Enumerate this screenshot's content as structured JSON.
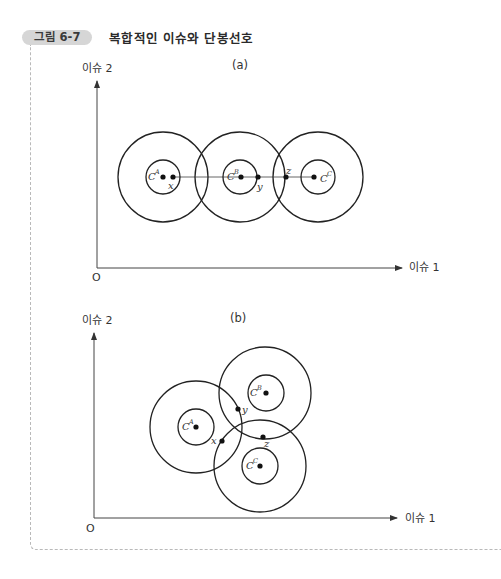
{
  "figure": {
    "badge": "그림 6-7",
    "title": "복합적인 이슈와 단봉선호"
  },
  "panels": [
    {
      "id": "a",
      "label": "(a)",
      "x_axis_label": "이슈 1",
      "y_axis_label": "이슈 2",
      "origin_label": "O",
      "circles": [
        {
          "name": "A",
          "center": [
            163,
            177
          ],
          "inner_r": 17,
          "outer_r": 45,
          "ideal_label": "C",
          "ideal_sup": "A"
        },
        {
          "name": "B",
          "center": [
            240,
            177
          ],
          "inner_r": 17,
          "outer_r": 45,
          "ideal_label": "C",
          "ideal_sup": "B"
        },
        {
          "name": "C",
          "center": [
            318,
            177
          ],
          "inner_r": 17,
          "outer_r": 45,
          "ideal_label": "C",
          "ideal_sup": "C"
        }
      ],
      "points": [
        {
          "label": "x",
          "pos": [
            173,
            177
          ]
        },
        {
          "label": "y",
          "pos": [
            258,
            177
          ]
        },
        {
          "label": "z",
          "pos": [
            286,
            177
          ]
        }
      ]
    },
    {
      "id": "b",
      "label": "(b)",
      "x_axis_label": "이슈 1",
      "y_axis_label": "이슈 2",
      "origin_label": "O",
      "circles": [
        {
          "name": "A",
          "center": [
            196,
            427
          ],
          "inner_r": 18,
          "outer_r": 46,
          "ideal_label": "C",
          "ideal_sup": "A"
        },
        {
          "name": "B",
          "center": [
            266,
            393
          ],
          "inner_r": 18,
          "outer_r": 46,
          "ideal_label": "C",
          "ideal_sup": "B"
        },
        {
          "name": "C",
          "center": [
            260,
            466
          ],
          "inner_r": 18,
          "outer_r": 46,
          "ideal_label": "C",
          "ideal_sup": "C"
        }
      ],
      "points": [
        {
          "label": "x",
          "pos": [
            222,
            441
          ]
        },
        {
          "label": "y",
          "pos": [
            238,
            409
          ]
        },
        {
          "label": "z",
          "pos": [
            263,
            437
          ]
        }
      ]
    }
  ]
}
